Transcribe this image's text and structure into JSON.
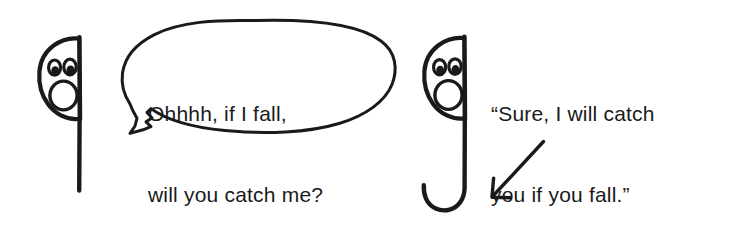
{
  "scene": {
    "title": "If I fall, will you catch me cartoon",
    "background_color": "#ffffff",
    "ink_color": "#1a1a1a",
    "width": 733,
    "height": 239
  },
  "speech_bubble": {
    "icon": "speech-bubble-oval",
    "speaker": "left-character",
    "lines": [
      "Ohhhh, if I fall,",
      "will you catch me?"
    ],
    "full_text": "Ohhhh, if I fall, will you catch me?"
  },
  "caption": {
    "icon": "quoted-caption",
    "speaker": "right-character",
    "lines": [
      "“Sure, I will catch",
      "you if you fall.”"
    ],
    "full_text": "“Sure, I will catch you if you fall.”"
  },
  "characters": [
    {
      "name": "left-character",
      "icon": "stick-figure-dot-i",
      "body_shape": "straight-vertical-stem",
      "face": "surprised-open-mouth",
      "eyes": 2
    },
    {
      "name": "right-character",
      "icon": "stick-figure-hook-j",
      "body_shape": "j-hook-stem",
      "face": "surprised-open-mouth",
      "eyes": 2
    }
  ],
  "annotations": [
    {
      "name": "pointer-arrow",
      "icon": "arrow-down-left-icon",
      "direction": "down-left",
      "points_to": "right-character-hook"
    }
  ]
}
